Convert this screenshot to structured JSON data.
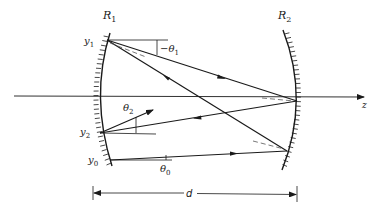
{
  "diagram": {
    "type": "optical-resonator-ray-diagram",
    "mirrors": [
      {
        "id": "mirror-1",
        "label": "R",
        "subscript": "1",
        "position": "left",
        "concave": "right"
      },
      {
        "id": "mirror-2",
        "label": "R",
        "subscript": "2",
        "position": "right",
        "concave": "left"
      }
    ],
    "axis": {
      "label": "z"
    },
    "points": [
      {
        "label": "y",
        "subscript": "1"
      },
      {
        "label": "y",
        "subscript": "2"
      },
      {
        "label": "y",
        "subscript": "0"
      }
    ],
    "angles": [
      {
        "label": "−θ",
        "subscript": "1"
      },
      {
        "label": "θ",
        "subscript": "2"
      },
      {
        "label": "θ",
        "subscript": "0"
      }
    ],
    "dimension": {
      "label": "d",
      "meaning": "mirror separation"
    },
    "colors": {
      "stroke": "#1a1a1a",
      "background": "#ffffff",
      "dashed": "#555555"
    }
  },
  "labels": {
    "r1_main": "R",
    "r1_sub": "1",
    "r2_main": "R",
    "r2_sub": "2",
    "y1_main": "y",
    "y1_sub": "1",
    "y2_main": "y",
    "y2_sub": "2",
    "y0_main": "y",
    "y0_sub": "0",
    "theta1_main": "−θ",
    "theta1_sub": "1",
    "theta2_main": "θ",
    "theta2_sub": "2",
    "theta0_main": "θ",
    "theta0_sub": "0",
    "axis_z": "z",
    "distance_d": "d"
  }
}
